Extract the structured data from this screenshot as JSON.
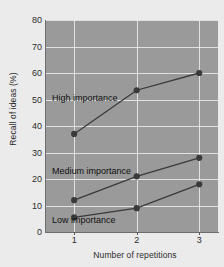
{
  "chart_data": {
    "type": "line",
    "title": "",
    "xlabel": "Number of repetitions",
    "ylabel": "Recall of ideas (%)",
    "x": [
      1,
      2,
      3
    ],
    "xticklabels": [
      "1",
      "2",
      "3"
    ],
    "yticklabels": [
      "0",
      "10",
      "20",
      "30",
      "40",
      "50",
      "60",
      "70",
      "80"
    ],
    "yticks": [
      0,
      10,
      20,
      30,
      40,
      50,
      60,
      70,
      80
    ],
    "ylim": [
      0,
      80
    ],
    "xlim": [
      0.55,
      3.3
    ],
    "grid": true,
    "legend_position": "inline-annotations",
    "plot_background": "#9a9a9a",
    "figure_background": "#ebebeb",
    "gridline_color": "#ededed",
    "series": [
      {
        "name": "High importance",
        "values": [
          37,
          53.5,
          60
        ],
        "color": "#3a3a3a",
        "marker": "circle"
      },
      {
        "name": "Medium importance",
        "values": [
          12,
          21,
          28
        ],
        "color": "#3a3a3a",
        "marker": "circle"
      },
      {
        "name": "Low importance",
        "values": [
          5.5,
          9,
          18
        ],
        "color": "#3a3a3a",
        "marker": "circle"
      }
    ],
    "annotations": [
      {
        "text": "High importance",
        "series": "High importance"
      },
      {
        "text": "Medium importance",
        "series": "Medium importance"
      },
      {
        "text": "Low importance",
        "series": "Low importance"
      }
    ]
  }
}
